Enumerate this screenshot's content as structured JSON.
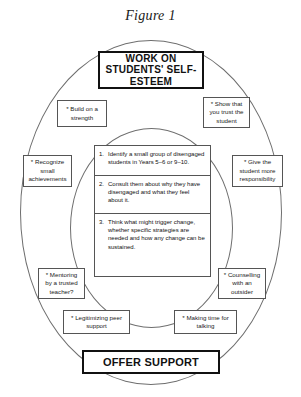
{
  "figure": {
    "caption": "Figure 1"
  },
  "header": {
    "label": "WORK ON STUDENTS' SELF-ESTEEM"
  },
  "footer": {
    "label": "OFFER SUPPORT"
  },
  "steps": [
    {
      "number": "1.",
      "text": "Identify a small group of disengaged students in Years 5–6 or 9–10."
    },
    {
      "number": "2.",
      "text": "Consult them about why they have disengaged and what they feel about it."
    },
    {
      "number": "3.",
      "text": "Think what might trigger change, whether specific strategies are needed and how any change can be sustained."
    }
  ],
  "callouts": [
    {
      "id": "build-strength",
      "text": "* Build on a strength"
    },
    {
      "id": "show-trust",
      "text": "* Show that you trust the student"
    },
    {
      "id": "recognize",
      "text": "* Recognize small achievements"
    },
    {
      "id": "responsibility",
      "text": "* Give the student more responsibility"
    },
    {
      "id": "mentoring",
      "text": "* Mentoring by a trusted teacher?"
    },
    {
      "id": "counselling",
      "text": "* Counselling with an outsider"
    },
    {
      "id": "peer-support",
      "text": "* Legitimizing peer support"
    },
    {
      "id": "making-time",
      "text": "* Making time for talking"
    }
  ],
  "colors": {
    "stroke": "#555555",
    "ellipse_stroke": "#6e6e6e",
    "emphasis_stroke": "#111111",
    "text": "#111111",
    "background": "#ffffff"
  }
}
